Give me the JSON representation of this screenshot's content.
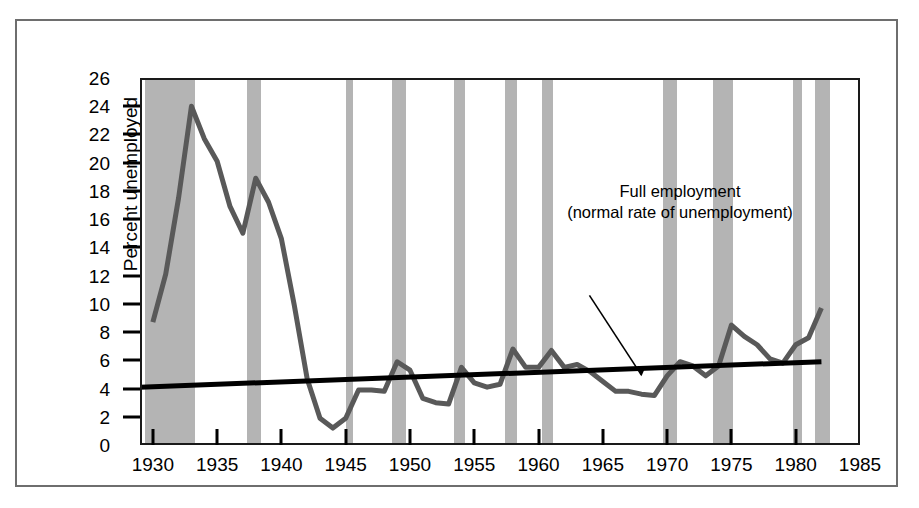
{
  "chart_data": {
    "type": "line",
    "title": "",
    "xlabel": "",
    "ylabel": "Percent unemployed",
    "xlim": [
      1929,
      1985
    ],
    "ylim": [
      0,
      26
    ],
    "xticks": [
      1930,
      1935,
      1940,
      1945,
      1950,
      1955,
      1960,
      1965,
      1970,
      1975,
      1980,
      1985
    ],
    "xtick_labels": [
      "1930",
      "1935",
      "1940",
      "1945",
      "1950",
      "1955",
      "1960",
      "1965",
      "1970",
      "1975",
      "1980",
      "1985"
    ],
    "yticks": [
      0,
      2,
      4,
      6,
      8,
      10,
      12,
      14,
      16,
      18,
      20,
      22,
      24,
      26
    ],
    "ytick_labels": [
      "0",
      "2",
      "4",
      "6",
      "8",
      "10",
      "12",
      "14",
      "16",
      "18",
      "20",
      "22",
      "24",
      "26"
    ],
    "grid": false,
    "legend": "none",
    "series": [
      {
        "name": "Unemployment rate",
        "color": "#595959",
        "width": 5,
        "x": [
          1930,
          1931,
          1932,
          1933,
          1934,
          1935,
          1936,
          1937,
          1938,
          1939,
          1940,
          1941,
          1942,
          1943,
          1944,
          1945,
          1946,
          1947,
          1948,
          1949,
          1950,
          1951,
          1952,
          1953,
          1954,
          1955,
          1956,
          1957,
          1958,
          1959,
          1960,
          1961,
          1962,
          1963,
          1964,
          1965,
          1966,
          1967,
          1968,
          1969,
          1970,
          1971,
          1972,
          1973,
          1974,
          1975,
          1976,
          1977,
          1978,
          1979,
          1980,
          1981,
          1982
        ],
        "y": [
          8.7,
          12.1,
          17.5,
          24.0,
          21.7,
          20.1,
          16.9,
          15.0,
          18.9,
          17.2,
          14.6,
          9.9,
          4.7,
          1.9,
          1.2,
          1.9,
          3.9,
          3.9,
          3.8,
          5.9,
          5.3,
          3.3,
          3.0,
          2.9,
          5.5,
          4.4,
          4.1,
          4.3,
          6.8,
          5.5,
          5.5,
          6.7,
          5.5,
          5.7,
          5.2,
          4.5,
          3.8,
          3.8,
          3.6,
          3.5,
          4.9,
          5.9,
          5.6,
          4.9,
          5.6,
          8.5,
          7.7,
          7.1,
          6.1,
          5.8,
          7.1,
          7.6,
          9.7
        ]
      },
      {
        "name": "Full employment (normal rate of unemployment)",
        "color": "#000000",
        "width": 5,
        "x": [
          1929,
          1982
        ],
        "y": [
          4.1,
          5.9
        ]
      }
    ],
    "shaded_bands": {
      "label": "recession",
      "color": "#b4b4b4",
      "ranges": [
        [
          1929.4,
          1933.3
        ],
        [
          1937.3,
          1938.4
        ],
        [
          1945.0,
          1945.6
        ],
        [
          1948.6,
          1949.7
        ],
        [
          1953.4,
          1954.3
        ],
        [
          1957.4,
          1958.3
        ],
        [
          1960.3,
          1961.1
        ],
        [
          1969.7,
          1970.8
        ],
        [
          1973.6,
          1975.1
        ],
        [
          1979.8,
          1980.5
        ],
        [
          1981.5,
          1982.7
        ]
      ]
    },
    "annotations": [
      {
        "name": "full-employment-callout",
        "line1": "Full employment",
        "line2": "(normal rate of unemployment)",
        "arrow_from": [
          1968.0,
          10.6
        ],
        "arrow_to": [
          1968.0,
          4.95
        ]
      }
    ]
  }
}
